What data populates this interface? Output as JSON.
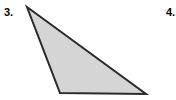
{
  "figure": {
    "canvas": {
      "width": 176,
      "height": 100,
      "background_color": "#ffffff"
    },
    "problems": [
      {
        "label": "3.",
        "name": "problem-number-3",
        "visible": "full"
      },
      {
        "label": "4.",
        "name": "problem-number-4",
        "visible": "clipped-at-right-edge"
      }
    ],
    "shape": {
      "name": "triangle",
      "type": "obtuse-scalene-triangle",
      "fill_color": "#d5d5d5",
      "stroke_color": "#2b2b2b",
      "stroke_width": 2,
      "points_attr": "27,7 146,94 60,93",
      "vertices": [
        {
          "name": "apex",
          "x": 27,
          "y": 7
        },
        {
          "name": "bottom-right",
          "x": 146,
          "y": 94
        },
        {
          "name": "bottom-left",
          "x": 60,
          "y": 93
        }
      ]
    }
  }
}
